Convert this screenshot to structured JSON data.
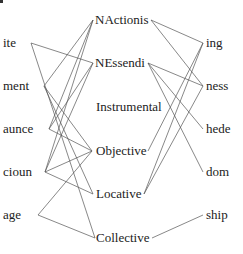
{
  "diagram": {
    "left_nodes": [
      {
        "id": "ite",
        "label": "ite",
        "x": 3,
        "y": 36,
        "ax": 31,
        "ay": 43
      },
      {
        "id": "ment",
        "label": "ment",
        "x": 3,
        "y": 79,
        "ax": 44,
        "ay": 86
      },
      {
        "id": "aunce",
        "label": "aunce",
        "x": 3,
        "y": 122,
        "ax": 49,
        "ay": 129
      },
      {
        "id": "cioun",
        "label": "cioun",
        "x": 3,
        "y": 165,
        "ax": 45,
        "ay": 172
      },
      {
        "id": "age",
        "label": "age",
        "x": 3,
        "y": 208,
        "ax": 38,
        "ay": 215
      }
    ],
    "middle_nodes": [
      {
        "id": "NActionis",
        "label": "NActionis",
        "x": 95,
        "y": 13,
        "lx": 93,
        "ly": 20,
        "rx": 151,
        "ry": 20
      },
      {
        "id": "NEssendi",
        "label": "NEssendi",
        "x": 95,
        "y": 56,
        "lx": 93,
        "ly": 63,
        "rx": 148,
        "ry": 63
      },
      {
        "id": "Instrumental",
        "label": "Instrumental",
        "x": 96,
        "y": 100,
        "lx": 95,
        "ly": 107,
        "rx": 163,
        "ry": 107
      },
      {
        "id": "Objective",
        "label": "Objective",
        "x": 96,
        "y": 144,
        "lx": 92,
        "ly": 151,
        "rx": 148,
        "ry": 151
      },
      {
        "id": "Locative",
        "label": "Locative",
        "x": 96,
        "y": 187,
        "lx": 93,
        "ly": 194,
        "rx": 144,
        "ry": 194
      },
      {
        "id": "Collective",
        "label": "Collective",
        "x": 96,
        "y": 231,
        "lx": 95,
        "ly": 238,
        "rx": 152,
        "ry": 238
      }
    ],
    "right_nodes": [
      {
        "id": "ing",
        "label": "ing",
        "x": 206,
        "y": 36,
        "ax": 203,
        "ay": 43
      },
      {
        "id": "ness",
        "label": "ness",
        "x": 206,
        "y": 79,
        "ax": 203,
        "ay": 86
      },
      {
        "id": "hede",
        "label": "hede",
        "x": 206,
        "y": 122,
        "ax": 203,
        "ay": 129
      },
      {
        "id": "dom",
        "label": "dom",
        "x": 206,
        "y": 165,
        "ax": 203,
        "ay": 172
      },
      {
        "id": "ship",
        "label": "ship",
        "x": 206,
        "y": 208,
        "ax": 203,
        "ay": 215
      }
    ],
    "left_edges": [
      [
        "ite",
        "NEssendi"
      ],
      [
        "ite",
        "Collective"
      ],
      [
        "ment",
        "NActionis"
      ],
      [
        "ment",
        "Objective"
      ],
      [
        "ment",
        "Locative"
      ],
      [
        "aunce",
        "NActionis"
      ],
      [
        "aunce",
        "NEssendi"
      ],
      [
        "aunce",
        "Objective"
      ],
      [
        "cioun",
        "NActionis"
      ],
      [
        "cioun",
        "NEssendi"
      ],
      [
        "cioun",
        "Objective"
      ],
      [
        "cioun",
        "Locative"
      ],
      [
        "age",
        "Objective"
      ],
      [
        "age",
        "Collective"
      ]
    ],
    "right_edges": [
      [
        "NActionis",
        "ing"
      ],
      [
        "NActionis",
        "ness"
      ],
      [
        "NEssendi",
        "ness"
      ],
      [
        "NEssendi",
        "hede"
      ],
      [
        "NEssendi",
        "dom"
      ],
      [
        "Objective",
        "ing"
      ],
      [
        "Locative",
        "ing"
      ],
      [
        "Locative",
        "ness"
      ],
      [
        "Collective",
        "ship"
      ]
    ]
  }
}
